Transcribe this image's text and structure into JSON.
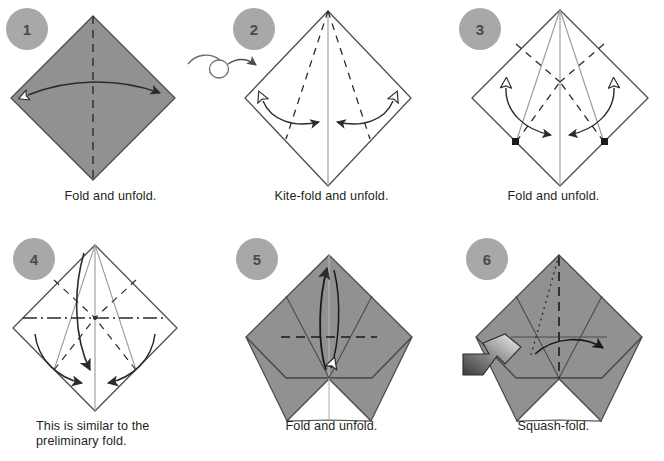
{
  "document": {
    "title": "Origami folding sequence diagram",
    "background_color": "#ffffff",
    "paper_front_color": "#8f8f8f",
    "paper_back_color": "#ffffff",
    "line_color": "#4d4d4d",
    "step_circle_color": "#a8a8a8",
    "step_number_color": "#4a4a4a",
    "caption_color": "#231f20"
  },
  "symbols": {
    "turnover": "turn-over-arrow",
    "valley_fold": "dashed-line",
    "mountain_fold": "dash-dot-line",
    "existing_crease": "thin-solid-line",
    "fold_arrow": "solid-arrow",
    "unfold_arrow": "hollow-arrowhead",
    "push_arrow": "shaded-block-arrow",
    "reference_point": "black-square-dot"
  },
  "steps": [
    {
      "number": "1",
      "caption_lines": [
        "Fold and unfold."
      ],
      "shaded": true,
      "creases": [
        "vertical valley fold"
      ],
      "arrows": [
        "double-headed horizontal fold-and-unfold arrow"
      ]
    },
    {
      "number": "2",
      "caption_lines": [
        "Kite-fold and unfold."
      ],
      "shaded": false,
      "creases": [
        "vertical center crease",
        "two kite valley folds from top vertex"
      ],
      "arrows": [
        "left fold-and-unfold arrow",
        "right fold-and-unfold arrow"
      ]
    },
    {
      "number": "3",
      "caption_lines": [
        "Fold and unfold."
      ],
      "shaded": false,
      "creases": [
        "vertical center crease",
        "kite creases",
        "two valley folds to side corners"
      ],
      "arrows": [
        "left fold-and-unfold arrow",
        "right fold-and-unfold arrow"
      ],
      "reference_points": 2
    },
    {
      "number": "4",
      "caption_lines": [
        "This is similar to the",
        "preliminary fold."
      ],
      "shaded": false,
      "creases": [
        "horizontal mountain fold",
        "kite creases",
        "valley folds"
      ],
      "arrows": [
        "center fold arrow",
        "left fold arrow",
        "right fold arrow"
      ]
    },
    {
      "number": "5",
      "caption_lines": [
        "Fold and unfold."
      ],
      "shaded": true,
      "creases": [
        "horizontal valley fold",
        "existing creases"
      ],
      "arrows": [
        "fold-and-unfold arrow up and back"
      ]
    },
    {
      "number": "6",
      "caption_lines": [
        "Squash-fold."
      ],
      "shaded": true,
      "creases": [
        "vertical valley fold",
        "dotted hidden crease",
        "horizontal crease"
      ],
      "arrows": [
        "squash fold arrow",
        "push block arrow"
      ]
    }
  ]
}
